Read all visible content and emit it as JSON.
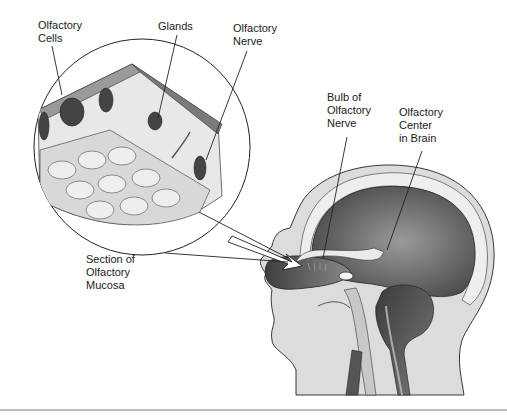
{
  "diagram": {
    "labels": {
      "olfactory_cells": [
        "Olfactory",
        "Cells"
      ],
      "glands": [
        "Glands"
      ],
      "olfactory_nerve": [
        "Olfactory",
        "Nerve"
      ],
      "bulb": [
        "Bulb of",
        "Olfactory",
        "Nerve"
      ],
      "center": [
        "Olfactory",
        "Center",
        "in Brain"
      ],
      "section": [
        "Section of",
        "Olfactory",
        "Mucosa"
      ]
    },
    "colors": {
      "skin": "#d9d9d9",
      "tissue_light": "#e6e6e6",
      "tissue_dark": "#5a5a5a",
      "brain": "#6b6b6b",
      "outline": "#222222",
      "epithelium": "#8a8a8a"
    }
  }
}
